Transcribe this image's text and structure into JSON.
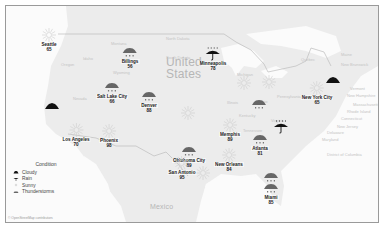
{
  "map": {
    "country_labels": [
      {
        "name": "United\nStates",
        "line1": "United",
        "line2": "States",
        "x": 160,
        "y": 55
      },
      {
        "name": "Mexico",
        "x": 148,
        "y": 200
      }
    ],
    "region_labels": [
      {
        "text": "Montana",
        "x": 110,
        "y": 41
      },
      {
        "text": "North Dakota",
        "x": 165,
        "y": 36
      },
      {
        "text": "South Dakota",
        "x": 165,
        "y": 55
      },
      {
        "text": "Idaho",
        "x": 82,
        "y": 56
      },
      {
        "text": "Oregon",
        "x": 60,
        "y": 62
      },
      {
        "text": "Wyoming",
        "x": 112,
        "y": 70
      },
      {
        "text": "Nevada",
        "x": 72,
        "y": 96
      },
      {
        "text": "Michigan",
        "x": 236,
        "y": 72
      },
      {
        "text": "Pennsylvania",
        "x": 276,
        "y": 94
      },
      {
        "text": "Ohio",
        "x": 258,
        "y": 99
      },
      {
        "text": "Illinois",
        "x": 226,
        "y": 100
      },
      {
        "text": "Kentucky",
        "x": 238,
        "y": 113
      },
      {
        "text": "Virginia",
        "x": 270,
        "y": 118
      },
      {
        "text": "Tennessee",
        "x": 242,
        "y": 128
      },
      {
        "text": "Quebec",
        "x": 300,
        "y": 57
      },
      {
        "text": "Maine",
        "x": 340,
        "y": 52
      },
      {
        "text": "New Brunswick",
        "x": 340,
        "y": 62
      },
      {
        "text": "Vermont",
        "x": 349,
        "y": 86
      },
      {
        "text": "New Hampshire",
        "x": 346,
        "y": 93
      },
      {
        "text": "Massachusetts",
        "x": 352,
        "y": 102
      },
      {
        "text": "Rhode Island",
        "x": 346,
        "y": 109
      },
      {
        "text": "Connecticut",
        "x": 340,
        "y": 116
      },
      {
        "text": "New Jersey",
        "x": 336,
        "y": 124
      },
      {
        "text": "Delaware",
        "x": 326,
        "y": 130
      },
      {
        "text": "Maryland",
        "x": 321,
        "y": 137
      },
      {
        "text": "District\nof Columbia",
        "x": 326,
        "y": 152
      }
    ],
    "markers": [
      {
        "city": "Seattle",
        "temp": "65",
        "condition": "sunny",
        "x": 48,
        "y": 34
      },
      {
        "city": "Billings",
        "temp": "56",
        "condition": "thunderstorms",
        "x": 129,
        "y": 51
      },
      {
        "city": "Salt Lake City",
        "temp": "66",
        "condition": "thunderstorms",
        "x": 111,
        "y": 86
      },
      {
        "city": "Denver",
        "temp": "88",
        "condition": "thunderstorms",
        "x": 148,
        "y": 95
      },
      {
        "city": "Minneapolis",
        "temp": "78",
        "condition": "rain",
        "x": 212,
        "y": 53
      },
      {
        "city": "New York City",
        "temp": "65",
        "condition": "sunny",
        "x": 316,
        "y": 87
      },
      {
        "city": "Los Angeles",
        "temp": "70",
        "condition": "sunny",
        "x": 75,
        "y": 129
      },
      {
        "city": "Phoenix",
        "temp": "98",
        "condition": "sunny",
        "x": 108,
        "y": 130
      },
      {
        "city": "Oklahoma City",
        "temp": "89",
        "condition": "thunderstorms",
        "x": 188,
        "y": 150
      },
      {
        "city": "Memphis",
        "temp": "89",
        "condition": "sunny",
        "x": 229,
        "y": 124
      },
      {
        "city": "Atlanta",
        "temp": "81",
        "condition": "thunderstorms",
        "x": 259,
        "y": 138
      },
      {
        "city": "San Antonio",
        "temp": "95",
        "condition": "sunny",
        "x": 181,
        "y": 162
      },
      {
        "city": "New Orleans",
        "temp": "84",
        "condition": "sunny",
        "x": 228,
        "y": 154
      },
      {
        "city": "Miami",
        "temp": "85",
        "condition": "thunderstorms",
        "x": 270,
        "y": 187
      }
    ],
    "unlabeled_markers": [
      {
        "condition": "cloudy",
        "x": 51,
        "y": 104
      },
      {
        "condition": "cloudy",
        "x": 332,
        "y": 78
      },
      {
        "condition": "sunny",
        "x": 243,
        "y": 82
      },
      {
        "condition": "sunny",
        "x": 268,
        "y": 81
      },
      {
        "condition": "sunny",
        "x": 202,
        "y": 172
      },
      {
        "condition": "sunny",
        "x": 187,
        "y": 112
      },
      {
        "condition": "thunderstorms",
        "x": 258,
        "y": 103
      },
      {
        "condition": "thunderstorms",
        "x": 270,
        "y": 176
      },
      {
        "condition": "rain",
        "x": 280,
        "y": 126
      }
    ]
  },
  "legend": {
    "title": "Condition",
    "items": [
      {
        "label": "Cloudy",
        "icon": "cloud-icon"
      },
      {
        "label": "Rain",
        "icon": "umbrella-icon"
      },
      {
        "label": "Sunny",
        "icon": "sun-icon"
      },
      {
        "label": "Thunderstorms",
        "icon": "storm-cloud-icon"
      }
    ]
  },
  "attribution": "© OpenStreetMap contributors",
  "colors": {
    "land": "#ececec",
    "water": "#fbfbfb",
    "border": "#9a9a9a",
    "icon_dark": "#111111",
    "icon_storm": "#666666",
    "icon_sun": "#cfcfcf"
  }
}
